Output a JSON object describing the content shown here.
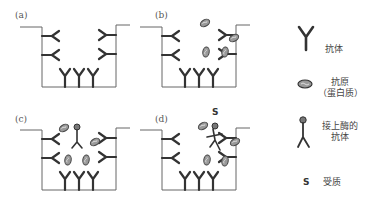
{
  "panels": [
    {
      "id": "a",
      "label": "(a)",
      "description": "Capture antibodies coated on well"
    },
    {
      "id": "b",
      "label": "(b)",
      "description": "Antigen (protein) binds to antibodies"
    },
    {
      "id": "c",
      "label": "(c)",
      "description": "Enzyme-linked antibody binds antigen"
    },
    {
      "id": "d",
      "label": "(d)",
      "description": "Substrate added to enzyme"
    }
  ],
  "substrate_mark": "S",
  "legend": {
    "antibody": {
      "label": "抗体"
    },
    "antigen": {
      "label_line1": "抗原",
      "label_line2": "（蛋白质）"
    },
    "enzyme_antibody": {
      "label_line1": "接上酶的",
      "label_line2": "抗体"
    },
    "substrate": {
      "symbol": "S",
      "label": "受质"
    }
  },
  "colors": {
    "line": "#555555",
    "antibody": "#333333",
    "antigen_fill": "#888888"
  }
}
